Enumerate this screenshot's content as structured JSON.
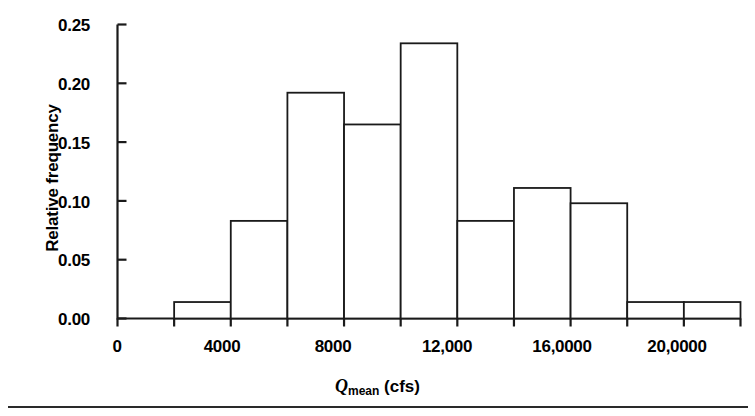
{
  "chart_data": {
    "type": "bar",
    "title": "",
    "subtitle": "",
    "xlabel": "Q_mean (cfs)",
    "xlabel_symbol": "Q",
    "xlabel_subscript": "mean",
    "xlabel_units": "(cfs)",
    "ylabel": "Relative frequency",
    "xlim": [
      0,
      22000
    ],
    "ylim": [
      0.0,
      0.25
    ],
    "grid": false,
    "legend": "none",
    "bin_width": 2000,
    "bin_edges": [
      2000,
      4000,
      6000,
      8000,
      10000,
      12000,
      14000,
      16000,
      18000,
      20000,
      22000
    ],
    "categories": [
      "2000-4000",
      "4000-6000",
      "6000-8000",
      "8000-10000",
      "10000-12000",
      "12000-14000",
      "14000-16000",
      "16000-18000",
      "18000-20000",
      "20000-22000"
    ],
    "values": [
      0.014,
      0.083,
      0.192,
      0.165,
      0.234,
      0.083,
      0.111,
      0.098,
      0.014,
      0.014
    ],
    "x_ticks_major": [
      0,
      4000,
      8000,
      12000,
      16000,
      20000
    ],
    "x_tick_labels": [
      "0",
      "4000",
      "8000",
      "12,000",
      "16,0000",
      "20,0000"
    ],
    "x_ticks_minor": [
      2000,
      6000,
      10000,
      14000,
      18000,
      22000
    ],
    "y_ticks": [
      0.0,
      0.05,
      0.1,
      0.15,
      0.2,
      0.25
    ],
    "y_tick_labels": [
      "0.00",
      "0.05",
      "0.10",
      "0.15",
      "0.20",
      "0.25"
    ],
    "line_color": "#1a1a1a",
    "bar_fill": "#ffffff"
  },
  "axes": {
    "y_title": "Relative frequency",
    "y_tick_labels": [
      "0.25",
      "0.20",
      "0.15",
      "0.10",
      "0.05",
      "0.00"
    ],
    "x_tick_labels": [
      "0",
      "4000",
      "8000",
      "12,000",
      "16,0000",
      "20,0000"
    ],
    "x_title_symbol": "Q",
    "x_title_subscript": "mean",
    "x_title_units": "(cfs)"
  }
}
